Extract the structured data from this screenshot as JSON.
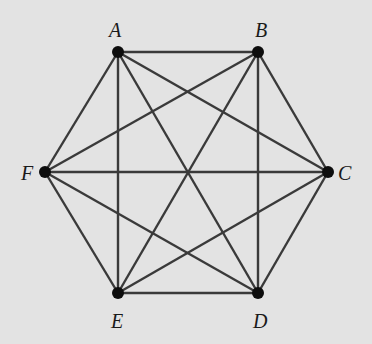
{
  "diagram": {
    "type": "complete graph K6",
    "background_color": "#e3e3e3",
    "edge_color": "#3a3a3a",
    "node_color": "#0d0d0d",
    "nodes": [
      {
        "id": "A",
        "label": "A",
        "x": 118,
        "y": 52,
        "label_x": 109,
        "label_y": 20
      },
      {
        "id": "B",
        "label": "B",
        "x": 258,
        "y": 52,
        "label_x": 255,
        "label_y": 20
      },
      {
        "id": "C",
        "label": "C",
        "x": 328,
        "y": 172,
        "label_x": 338,
        "label_y": 163
      },
      {
        "id": "D",
        "label": "D",
        "x": 258,
        "y": 293,
        "label_x": 253,
        "label_y": 311
      },
      {
        "id": "E",
        "label": "E",
        "x": 118,
        "y": 293,
        "label_x": 111,
        "label_y": 311
      },
      {
        "id": "F",
        "label": "F",
        "x": 45,
        "y": 172,
        "label_x": 21,
        "label_y": 163
      }
    ],
    "edges": [
      [
        "A",
        "B"
      ],
      [
        "A",
        "C"
      ],
      [
        "A",
        "D"
      ],
      [
        "A",
        "E"
      ],
      [
        "A",
        "F"
      ],
      [
        "B",
        "C"
      ],
      [
        "B",
        "D"
      ],
      [
        "B",
        "E"
      ],
      [
        "B",
        "F"
      ],
      [
        "C",
        "D"
      ],
      [
        "C",
        "E"
      ],
      [
        "C",
        "F"
      ],
      [
        "D",
        "E"
      ],
      [
        "D",
        "F"
      ],
      [
        "E",
        "F"
      ]
    ]
  }
}
